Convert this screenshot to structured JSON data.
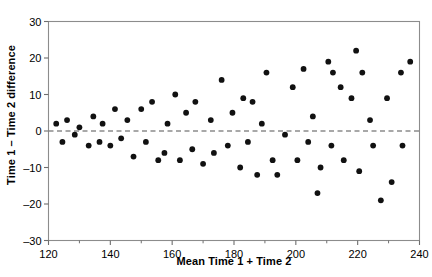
{
  "chart_data": {
    "type": "scatter",
    "title": "",
    "xlabel": "Mean Time 1 + Time 2",
    "ylabel": "Time 1 – Time 2 difference",
    "xlim": [
      120,
      240
    ],
    "ylim": [
      -30,
      30
    ],
    "xticks": [
      120,
      140,
      160,
      180,
      200,
      220,
      240
    ],
    "xticklabels": [
      "120",
      "140",
      "160",
      "180",
      "200",
      "220",
      "240"
    ],
    "x_minor_ticks": [
      130,
      150,
      170,
      190,
      210,
      230
    ],
    "yticks": [
      -30,
      -20,
      -10,
      0,
      10,
      20,
      30
    ],
    "yticklabels": [
      "–30",
      "–20",
      "–10",
      "0",
      "10",
      "20",
      "30"
    ],
    "grid": false,
    "legend": null,
    "marker": {
      "shape": "circle",
      "color": "#111111",
      "size": 5
    },
    "reference_line": {
      "y": 0,
      "style": "dashed",
      "color": "#8c8c8c",
      "label": ""
    },
    "points": [
      {
        "x": 122.5,
        "y": 2
      },
      {
        "x": 124.5,
        "y": -3
      },
      {
        "x": 126.0,
        "y": 3
      },
      {
        "x": 128.5,
        "y": -1
      },
      {
        "x": 130.0,
        "y": 1
      },
      {
        "x": 133.0,
        "y": -4
      },
      {
        "x": 134.5,
        "y": 4
      },
      {
        "x": 136.5,
        "y": -3
      },
      {
        "x": 137.5,
        "y": 2
      },
      {
        "x": 140.0,
        "y": -4
      },
      {
        "x": 141.5,
        "y": 6
      },
      {
        "x": 143.5,
        "y": -2
      },
      {
        "x": 145.5,
        "y": 3
      },
      {
        "x": 147.5,
        "y": -7
      },
      {
        "x": 150.0,
        "y": 6
      },
      {
        "x": 151.5,
        "y": -3
      },
      {
        "x": 153.5,
        "y": 8
      },
      {
        "x": 155.5,
        "y": -8
      },
      {
        "x": 157.5,
        "y": -6
      },
      {
        "x": 158.5,
        "y": 2
      },
      {
        "x": 161.0,
        "y": 10
      },
      {
        "x": 162.5,
        "y": -8
      },
      {
        "x": 164.5,
        "y": 5
      },
      {
        "x": 166.5,
        "y": -5
      },
      {
        "x": 167.5,
        "y": 8
      },
      {
        "x": 170.0,
        "y": -9
      },
      {
        "x": 172.5,
        "y": 3
      },
      {
        "x": 173.5,
        "y": -6
      },
      {
        "x": 176.0,
        "y": 14
      },
      {
        "x": 178.0,
        "y": -4
      },
      {
        "x": 179.5,
        "y": 5
      },
      {
        "x": 182.0,
        "y": -10
      },
      {
        "x": 183.0,
        "y": 9
      },
      {
        "x": 184.5,
        "y": -3
      },
      {
        "x": 186.0,
        "y": 8
      },
      {
        "x": 187.5,
        "y": -12
      },
      {
        "x": 189.0,
        "y": 2
      },
      {
        "x": 190.5,
        "y": 16
      },
      {
        "x": 192.5,
        "y": -8
      },
      {
        "x": 194.0,
        "y": -12
      },
      {
        "x": 196.5,
        "y": -1
      },
      {
        "x": 199.0,
        "y": 12
      },
      {
        "x": 200.5,
        "y": -8
      },
      {
        "x": 202.5,
        "y": 17
      },
      {
        "x": 204.0,
        "y": -3
      },
      {
        "x": 205.5,
        "y": 4
      },
      {
        "x": 207.0,
        "y": -17
      },
      {
        "x": 208.0,
        "y": -10
      },
      {
        "x": 210.5,
        "y": 19
      },
      {
        "x": 211.5,
        "y": -4
      },
      {
        "x": 212.0,
        "y": 16
      },
      {
        "x": 214.5,
        "y": 12
      },
      {
        "x": 215.5,
        "y": -8
      },
      {
        "x": 218.0,
        "y": 9
      },
      {
        "x": 219.5,
        "y": 22
      },
      {
        "x": 220.5,
        "y": -11
      },
      {
        "x": 221.5,
        "y": 16
      },
      {
        "x": 224.0,
        "y": 3
      },
      {
        "x": 225.0,
        "y": -4
      },
      {
        "x": 227.5,
        "y": -19
      },
      {
        "x": 229.5,
        "y": 9
      },
      {
        "x": 231.0,
        "y": -14
      },
      {
        "x": 234.0,
        "y": 16
      },
      {
        "x": 234.5,
        "y": -4
      },
      {
        "x": 237.0,
        "y": 19
      }
    ]
  },
  "axis": {
    "frame_color": "#8c8c8c",
    "tick_color": "#6e6e6e"
  }
}
